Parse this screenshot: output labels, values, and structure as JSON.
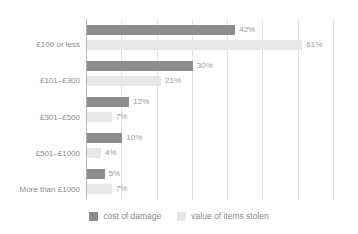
{
  "chart_data": {
    "type": "bar",
    "orientation": "horizontal",
    "title": "",
    "xlabel": "",
    "ylabel": "",
    "categories": [
      "£100 or less",
      "£101–£300",
      "£301–£500",
      "£501–£1000",
      "More than £1000"
    ],
    "series": [
      {
        "name": "cost of damage",
        "color": "#8c8c8c",
        "values": [
          42,
          30,
          12,
          10,
          5
        ],
        "value_labels": [
          "42%",
          "30%",
          "12%",
          "10%",
          "5%"
        ]
      },
      {
        "name": "value of items stolen",
        "color": "#e7e7e7",
        "values": [
          61,
          21,
          7,
          4,
          7
        ],
        "value_labels": [
          "61%",
          "21%",
          "7%",
          "4%",
          "7%"
        ]
      }
    ],
    "xlim": [
      0,
      70
    ],
    "gridline_values": [
      10,
      20,
      30,
      40,
      50,
      60,
      70
    ],
    "grid": true,
    "legend_position": "bottom",
    "value_suffix": "%"
  },
  "legend": {
    "items": [
      {
        "label": "cost of damage",
        "color": "#8c8c8c"
      },
      {
        "label": "value of items stolen",
        "color": "#e7e7e7"
      }
    ]
  }
}
